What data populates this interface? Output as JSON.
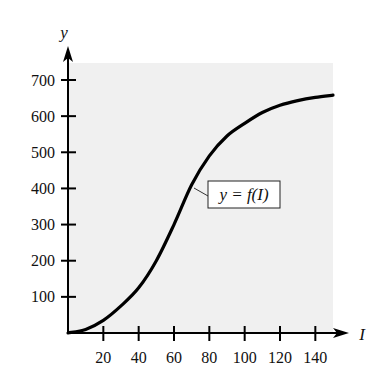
{
  "chart_data": {
    "type": "line",
    "title": "",
    "xlabel": "I",
    "ylabel": "y",
    "xlim": [
      0,
      150
    ],
    "ylim": [
      0,
      750
    ],
    "x_ticks": [
      20,
      40,
      60,
      80,
      100,
      120,
      140
    ],
    "y_ticks": [
      100,
      200,
      300,
      400,
      500,
      600,
      700
    ],
    "grid": false,
    "legend": null,
    "annotations": [
      {
        "text": "y = f(I)",
        "boxed": true,
        "points_to_x": 72
      }
    ],
    "background_color": "#f0f0f0",
    "series": [
      {
        "name": "y = f(I)",
        "color": "#000000",
        "x": [
          0,
          10,
          20,
          30,
          40,
          50,
          60,
          70,
          80,
          90,
          100,
          110,
          120,
          130,
          140,
          150
        ],
        "values": [
          0,
          10,
          35,
          75,
          125,
          200,
          300,
          410,
          490,
          545,
          580,
          610,
          630,
          643,
          652,
          658
        ]
      }
    ]
  },
  "labels": {
    "y_axis": "y",
    "x_axis": "I",
    "function": "y = f(I)",
    "x_ticks": [
      "20",
      "40",
      "60",
      "80",
      "100",
      "120",
      "140"
    ],
    "y_ticks": [
      "100",
      "200",
      "300",
      "400",
      "500",
      "600",
      "700"
    ]
  }
}
